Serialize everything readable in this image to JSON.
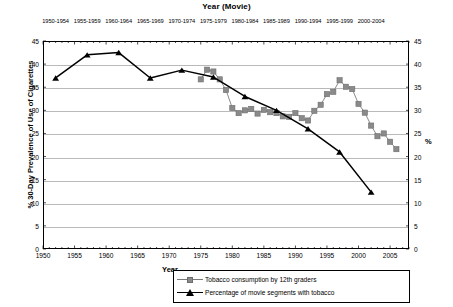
{
  "chart_data": {
    "type": "line",
    "title": "Year (Movie)",
    "xlabel": "Year",
    "ylabel": "% 30-Day Prevalence of Use of Cigarettes",
    "ylabel_right": "%",
    "xlim": [
      1950,
      2008
    ],
    "ylim": [
      0,
      45
    ],
    "ytick_step": 5,
    "grid": true,
    "legend_position": "bottom-right",
    "yticks": [
      0,
      5,
      10,
      15,
      20,
      25,
      30,
      35,
      40,
      45
    ],
    "yticks_right": [
      0,
      5,
      10,
      15,
      20,
      25,
      30,
      35,
      40,
      45
    ],
    "xticks": [
      1950,
      1955,
      1960,
      1965,
      1970,
      1975,
      1980,
      1985,
      1990,
      1995,
      2000,
      2005
    ],
    "top_axis_label": "Year (Movie)",
    "top_xticks": [
      "1950-1954",
      "1955-1959",
      "1960-1964",
      "1965-1969",
      "1970-1974",
      "1975-1979",
      "1980-1984",
      "1985-1989",
      "1990-1994",
      "1995-1999",
      "2000-2004"
    ],
    "series": [
      {
        "name": "Tobacco consumption by 12th graders",
        "marker": "square",
        "color": "#8a8a8a",
        "line_color": "#8a8a8a",
        "x": [
          1975,
          1976,
          1977,
          1978,
          1979,
          1980,
          1981,
          1982,
          1983,
          1984,
          1985,
          1986,
          1987,
          1988,
          1989,
          1990,
          1991,
          1992,
          1993,
          1994,
          1995,
          1996,
          1997,
          1998,
          1999,
          2000,
          2001,
          2002,
          2003,
          2004,
          2005,
          2006
        ],
        "values": [
          36.7,
          38.8,
          38.4,
          36.7,
          34.4,
          30.5,
          29.4,
          30.0,
          30.3,
          29.3,
          30.1,
          29.6,
          29.4,
          28.7,
          28.6,
          29.4,
          28.3,
          27.8,
          29.9,
          31.2,
          33.5,
          34.0,
          36.5,
          35.1,
          34.6,
          31.4,
          29.5,
          26.7,
          24.4,
          25.0,
          23.2,
          21.6
        ]
      },
      {
        "name": "Percentage of movie segments with tobacco",
        "marker": "triangle",
        "color": "#000000",
        "line_color": "#000000",
        "x": [
          1952,
          1957,
          1962,
          1967,
          1972,
          1977,
          1982,
          1987,
          1992,
          1997,
          2002
        ],
        "values": [
          37.0,
          42.0,
          42.5,
          37.0,
          38.7,
          37.2,
          33.0,
          30.0,
          26.0,
          21.0,
          12.3
        ]
      }
    ]
  },
  "legend": {
    "items": [
      {
        "label": "Tobacco consumption by 12th graders",
        "marker": "square"
      },
      {
        "label": "Percentage of movie segments with tobacco",
        "marker": "triangle"
      }
    ]
  }
}
